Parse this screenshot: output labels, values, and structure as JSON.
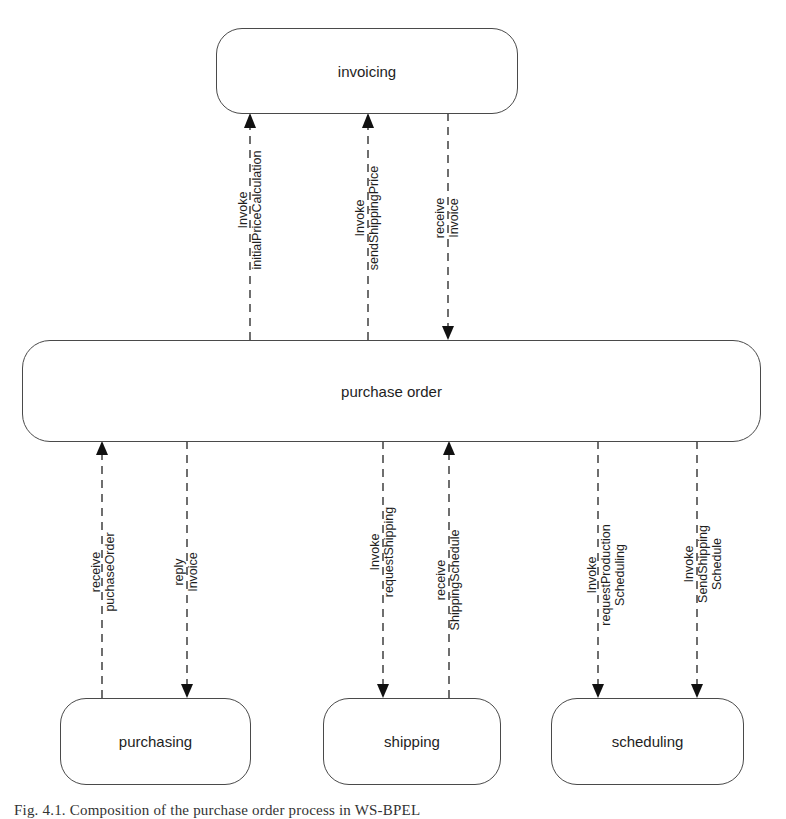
{
  "diagram": {
    "nodes": {
      "invoicing": "invoicing",
      "purchase_order": "purchase order",
      "purchasing": "purchasing",
      "shipping": "shipping",
      "scheduling": "scheduling"
    },
    "edges": [
      {
        "id": "e1",
        "from": "purchase order",
        "to": "invoicing",
        "line1": "Invoke",
        "line2": "initialPriceCalculation",
        "line3": ""
      },
      {
        "id": "e2",
        "from": "purchase order",
        "to": "invoicing",
        "line1": "Invoke",
        "line2": "sendShippingPrice",
        "line3": ""
      },
      {
        "id": "e3",
        "from": "invoicing",
        "to": "purchase order",
        "line1": "receive",
        "line2": "Invoice",
        "line3": ""
      },
      {
        "id": "e4",
        "from": "purchasing",
        "to": "purchase order",
        "line1": "receive",
        "line2": "puchaseOrder",
        "line3": ""
      },
      {
        "id": "e5",
        "from": "purchase order",
        "to": "purchasing",
        "line1": "reply",
        "line2": "Invoice",
        "line3": ""
      },
      {
        "id": "e6",
        "from": "purchase order",
        "to": "shipping",
        "line1": "Invoke",
        "line2": "requestShipping",
        "line3": ""
      },
      {
        "id": "e7",
        "from": "shipping",
        "to": "purchase order",
        "line1": "receive",
        "line2": "ShippingSchedule",
        "line3": ""
      },
      {
        "id": "e8",
        "from": "purchase order",
        "to": "scheduling",
        "line1": "Invoke",
        "line2": "requestProduction",
        "line3": "Scheduling"
      },
      {
        "id": "e9",
        "from": "purchase order",
        "to": "scheduling",
        "line1": "Invoke",
        "line2": "SendShipping",
        "line3": "Schedule"
      }
    ],
    "caption": "Fig. 4.1. Composition of the purchase order process in WS-BPEL"
  }
}
